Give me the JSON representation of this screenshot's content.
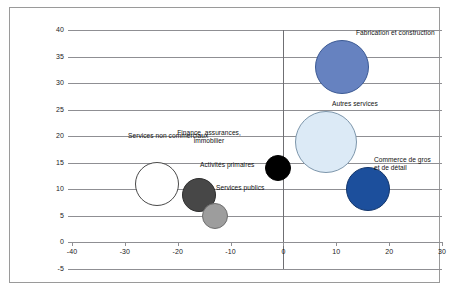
{
  "figure": {
    "background_color": "#ffffff",
    "frame_color": "#9a9a9a",
    "gridline_color": "#8f8f93"
  },
  "chart_data": {
    "type": "scatter",
    "title": "",
    "subtitle": "",
    "xlabel": "",
    "ylabel": "",
    "xlim": [
      -40,
      30
    ],
    "ylim": [
      -5,
      40
    ],
    "grid": "horizontal",
    "legend": "none (direct bubble labels)",
    "x_ticks": [
      "-40",
      "-30",
      "-20",
      "-10",
      "0",
      "10",
      "20",
      "30"
    ],
    "x_tick_values": [
      -40,
      -30,
      -20,
      -10,
      0,
      10,
      20,
      30
    ],
    "y_ticks": [
      "40",
      "35",
      "30",
      "25",
      "20",
      "15",
      "10",
      "5",
      "0",
      "-5"
    ],
    "y_tick_values": [
      40,
      35,
      30,
      25,
      20,
      15,
      10,
      5,
      0,
      -5
    ],
    "zero_vertical_line": 0,
    "points": [
      {
        "label": "Fabrication et construction",
        "x": 11,
        "y": 33,
        "size": 27,
        "color": "#6682c0",
        "border_color": "#3c5a94",
        "label_align": "left",
        "label_x": 356,
        "label_y": 29
      },
      {
        "label": "Autres services",
        "x": 8,
        "y": 19,
        "size": 31,
        "color": "#dceaf6",
        "border_color": "#7d96ab",
        "label_align": "left",
        "label_x": 332,
        "label_y": 100
      },
      {
        "label": "Commerce de gros\net de détail",
        "x": 16,
        "y": 10,
        "size": 22,
        "color": "#1c4f9c",
        "border_color": "#12356b",
        "label_align": "left",
        "label_x": 374,
        "label_y": 156
      },
      {
        "label": "Finance, assurances,\nimmobilier",
        "x": -1,
        "y": 14,
        "size": 13,
        "color": "#000000",
        "border_color": "#000000",
        "label_align": "center",
        "label_x": 209,
        "label_y": 129
      },
      {
        "label": "Services non commerciaux",
        "x": -24,
        "y": 11,
        "size": 22,
        "color": "#ffffff",
        "border_color": "#4a4a4a",
        "label_align": "left",
        "label_x": 128,
        "label_y": 132
      },
      {
        "label": "Activités primaires",
        "x": -16,
        "y": 9,
        "size": 17,
        "color": "#474747",
        "border_color": "#2e2e2e",
        "label_align": "left",
        "label_x": 200,
        "label_y": 161
      },
      {
        "label": "Services publics",
        "x": -13,
        "y": 5,
        "size": 13,
        "color": "#9d9d9d",
        "border_color": "#6e6e6e",
        "label_align": "left",
        "label_x": 216,
        "label_y": 184
      }
    ]
  }
}
